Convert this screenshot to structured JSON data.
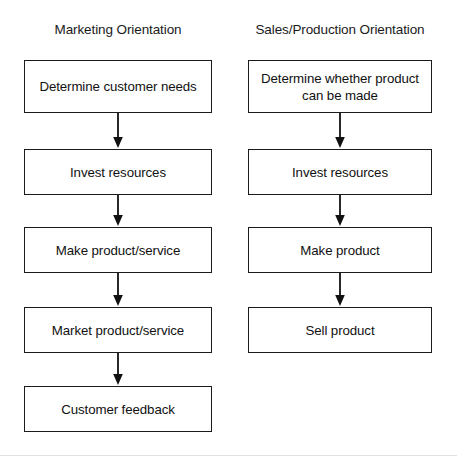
{
  "diagram": {
    "title_left": "Marketing Orientation",
    "title_right": "Sales/Production Orientation",
    "columns": [
      {
        "id": "marketing-orientation",
        "heading": "Marketing Orientation",
        "steps": [
          "Determine customer needs",
          "Invest resources",
          "Make product/service",
          "Market product/service",
          "Customer feedback"
        ]
      },
      {
        "id": "sales-production-orientation",
        "heading": "Sales/Production Orientation",
        "steps": [
          "Determine whether product can be made",
          "Invest resources",
          "Make product",
          "Sell product"
        ]
      }
    ],
    "connector": {
      "type": "down-arrow",
      "count_left": 4,
      "count_right": 3
    },
    "colors": {
      "background": "#ffffff",
      "box_border": "#1b1b1b",
      "box_fill": "#ffffff",
      "text": "#111111",
      "arrow": "#111111",
      "bottom_rule": "#e2e2e2"
    }
  }
}
